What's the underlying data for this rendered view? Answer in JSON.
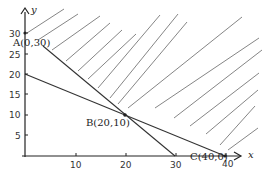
{
  "diagram": {
    "type": "linear-programming-feasible-region",
    "axes": {
      "x_label": "x",
      "y_label": "y",
      "x_ticks": [
        "10",
        "20",
        "30",
        "40"
      ],
      "y_ticks": [
        "5",
        "10",
        "15",
        "20",
        "25",
        "30"
      ]
    },
    "points": {
      "A": "A(0,30)",
      "B": "B(20,10)",
      "C": "C(40,0)"
    },
    "lines": [
      {
        "name": "line-1",
        "from": [
          0,
          30
        ],
        "to": [
          30,
          0
        ]
      },
      {
        "name": "line-2",
        "from": [
          0,
          20
        ],
        "to": [
          40,
          0
        ]
      }
    ],
    "shaded_region": "above both lines (hatched)",
    "colors": {
      "line": "#333333",
      "hatch": "#555555",
      "text": "#222222"
    }
  }
}
